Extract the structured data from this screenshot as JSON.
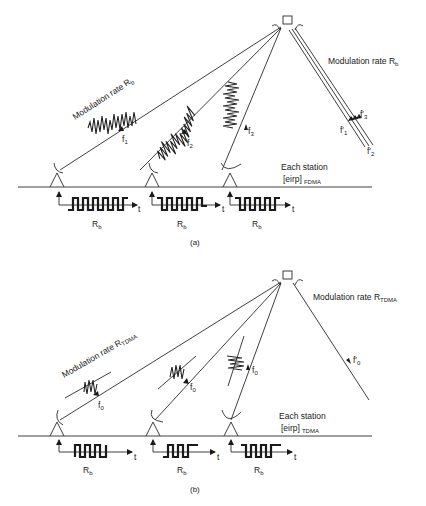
{
  "panel_a": {
    "caption": "(a)",
    "uplink_label": "Modulation rate R",
    "uplink_label_sub": "b",
    "downlink_label": "Modulation rate R",
    "downlink_label_sub": "b",
    "carrier_labels": [
      "f",
      "f",
      "f"
    ],
    "carrier_subs": [
      "1",
      "2",
      "3"
    ],
    "downlink_carriers": [
      {
        "label": "f′",
        "sub": "1"
      },
      {
        "label": "f′",
        "sub": "2"
      },
      {
        "label": "f′",
        "sub": "3"
      }
    ],
    "station_note_line1": "Each station",
    "station_note_line2": "[eirp]",
    "station_note_sub": "FDMA",
    "bit_rate_labels": [
      "R",
      "R",
      "R"
    ],
    "bit_rate_subs": [
      "b",
      "b",
      "b"
    ],
    "time_axis_label": "t"
  },
  "panel_b": {
    "caption": "(b)",
    "uplink_label": "Modulation rate R",
    "uplink_label_sub": "TDMA",
    "downlink_label": "Modulation rate R",
    "downlink_label_sub": "TDMA",
    "carrier_labels": [
      "f",
      "f",
      "f"
    ],
    "carrier_subs": [
      "0",
      "0",
      "0"
    ],
    "downlink_carrier": {
      "label": "f′",
      "sub": "0"
    },
    "station_note_line1": "Each station",
    "station_note_line2": "[eirp]",
    "station_note_sub": "TDMA",
    "bit_rate_labels": [
      "R",
      "R",
      "R"
    ],
    "bit_rate_subs": [
      "b",
      "b",
      "b"
    ],
    "time_axis_label": "t"
  }
}
